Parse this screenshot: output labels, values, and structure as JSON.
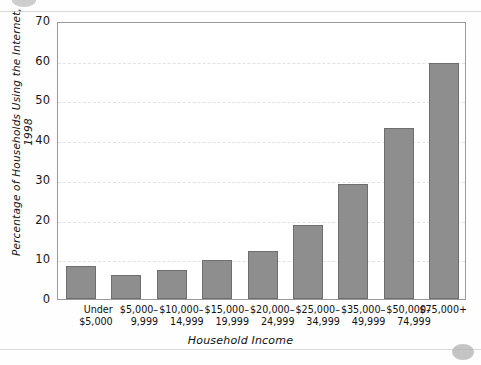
{
  "chart_data": {
    "type": "bar",
    "title": "",
    "xlabel": "Household Income",
    "ylabel": "Percentage of Households Using the Internet, 1998",
    "categories": [
      "Under\n$5,000",
      "$5,000–\n9,999",
      "$10,000–\n14,999",
      "$15,000–\n19,999",
      "$20,000–\n24,999",
      "$25,000–\n34,999",
      "$35,000–\n49,999",
      "$50,000–\n74,999",
      "$75,000+"
    ],
    "values": [
      8.3,
      6.0,
      7.3,
      9.9,
      12.0,
      18.7,
      29.0,
      43.0,
      59.5
    ],
    "ylim": [
      0,
      70
    ],
    "yticks": [
      0,
      10,
      20,
      30,
      40,
      50,
      60,
      70
    ],
    "ytick_labels": [
      "0",
      "10",
      "20",
      "30",
      "40",
      "50",
      "60",
      "70"
    ],
    "grid": true,
    "legend": "none",
    "bar_color": "#8e8e8e",
    "bar_border_color": "#6e6e6e",
    "grid_color": "#e2e2e2",
    "axis_color": "#9a9a9a"
  }
}
